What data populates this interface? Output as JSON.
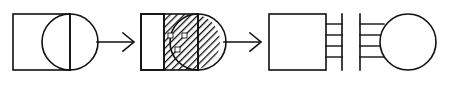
{
  "figure": {
    "title": "Process sequence diagram",
    "canvas": {
      "width": 450,
      "height": 89,
      "background": "#ffffff"
    },
    "line_color": "#101010",
    "steps": [
      {
        "id": "step-1",
        "label": "Square with overlapping circle, vertical divider",
        "shapes": [
          "square",
          "circle",
          "vertical-line"
        ],
        "filled": false,
        "x": 13,
        "y": 14,
        "width": 57,
        "height": 56
      },
      {
        "id": "step-2",
        "label": "Square with hatched right section, three white dots, circle cap",
        "shapes": [
          "square",
          "hatch-region",
          "circle",
          "vertical-line",
          "dots"
        ],
        "filled": true,
        "hatch": "diagonal-45",
        "dot_count": 3,
        "x": 141,
        "y": 14,
        "width": 57,
        "height": 56
      },
      {
        "id": "step-3",
        "label": "Square with four-rung comb on right side",
        "shapes": [
          "square",
          "comb"
        ],
        "filled": false,
        "rungs": 4,
        "x": 269,
        "y": 14,
        "width": 57,
        "height": 56
      },
      {
        "id": "step-4",
        "label": "Four-rung comb attached to circle",
        "shapes": [
          "comb",
          "circle"
        ],
        "filled": false,
        "rungs": 4,
        "x": 360,
        "y": 14,
        "width": 76,
        "height": 56
      }
    ],
    "arrows": [
      {
        "id": "arrow-1",
        "from": "step-1",
        "to": "step-2",
        "direction": "right",
        "x1": 95,
        "y1": 42,
        "x2": 133,
        "y2": 42
      },
      {
        "id": "arrow-2",
        "from": "step-2",
        "to": "step-3",
        "direction": "right",
        "x1": 222,
        "y1": 42,
        "x2": 260,
        "y2": 42
      }
    ]
  }
}
